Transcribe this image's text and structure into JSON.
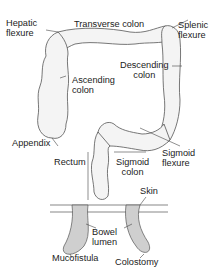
{
  "diagram": {
    "colon_labels": {
      "hepatic_flexure": [
        "Hepatic",
        "flexure"
      ],
      "transverse_colon": "Transverse colon",
      "splenic_flexure": [
        "Splenic",
        "flexure"
      ],
      "descending_colon": [
        "Descending",
        "colon"
      ],
      "ascending_colon": [
        "Ascending",
        "colon"
      ],
      "appendix": "Appendix",
      "sigmoid_flexure": [
        "Sigmoid",
        "flexure"
      ],
      "rectum": "Rectum",
      "sigmoid_colon": [
        "Sigmoid",
        "colon"
      ]
    },
    "stoma_labels": {
      "skin": "Skin",
      "bowel_lumen": [
        "Bowel",
        "lumen"
      ],
      "mucofistula": "Mucofistula",
      "colostomy": "Colostomy"
    },
    "colors": {
      "outline": "#555555",
      "fill": "#f4f4f4",
      "lumen": "#cfcfcf",
      "text": "#222222"
    }
  }
}
